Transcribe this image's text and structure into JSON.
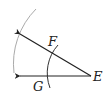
{
  "diagram": {
    "type": "geometric-construction",
    "points": {
      "E": {
        "label": "E",
        "x": 91,
        "y": 76
      },
      "F": {
        "label": "F",
        "x": 55,
        "y": 55
      },
      "G": {
        "label": "G",
        "x": 50,
        "y": 76
      }
    },
    "labels": {
      "E": "E",
      "F": "F",
      "G": "G"
    },
    "colors": {
      "ray": "#222222",
      "small_arc": "#333333",
      "large_arc": "#aaaaaa",
      "text": "#222222"
    }
  }
}
